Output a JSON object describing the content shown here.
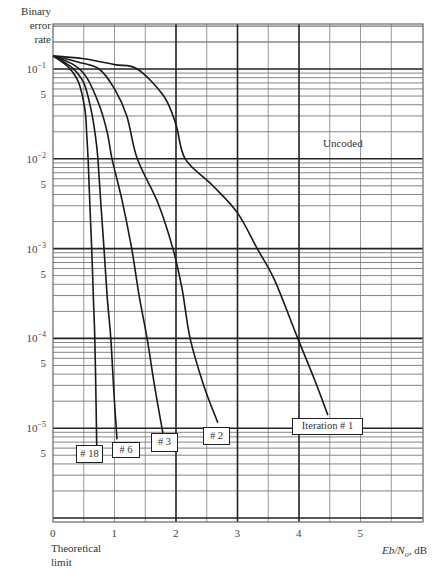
{
  "chart_data": {
    "type": "line",
    "title": "",
    "ylabel": "Binary error rate",
    "xlabel": "Eb/No, dB",
    "xlabel_parts": {
      "main": "Eb/Ν",
      "sub": "o",
      "unit": ", dB"
    },
    "y_scale": "log",
    "ylim": [
      1e-06,
      0.316
    ],
    "xlim": [
      0,
      6
    ],
    "grid": true,
    "x_ticks": [
      {
        "value": 0,
        "label": "0"
      },
      {
        "value": 1,
        "label": "1"
      },
      {
        "value": 2,
        "label": "2"
      },
      {
        "value": 3,
        "label": "3"
      },
      {
        "value": 4,
        "label": "4"
      },
      {
        "value": 5,
        "label": "5"
      }
    ],
    "y_ticks": [
      {
        "value": 0.1,
        "base": "10",
        "exp": "−1"
      },
      {
        "value": 0.05,
        "base": "5",
        "exp": ""
      },
      {
        "value": 0.01,
        "base": "10",
        "exp": "−2"
      },
      {
        "value": 0.005,
        "base": "5",
        "exp": ""
      },
      {
        "value": 0.001,
        "base": "10",
        "exp": "−3"
      },
      {
        "value": 0.0005,
        "base": "5",
        "exp": ""
      },
      {
        "value": 0.0001,
        "base": "10",
        "exp": "−4"
      },
      {
        "value": 5e-05,
        "base": "5",
        "exp": ""
      },
      {
        "value": 1e-05,
        "base": "10",
        "exp": "−5"
      },
      {
        "value": 5e-06,
        "base": "5",
        "exp": ""
      }
    ],
    "annotations": [
      {
        "text": "Uncoded",
        "x": 4.4,
        "y": 0.013
      },
      {
        "text": "Theoretical limit",
        "x": 0,
        "y": "below axis"
      }
    ],
    "series": [
      {
        "name": "Iteration # 1",
        "label": "Iteration # 1",
        "points": [
          [
            0,
            0.14
          ],
          [
            0.5,
            0.13
          ],
          [
            1.0,
            0.112
          ],
          [
            1.37,
            0.1
          ],
          [
            1.8,
            0.05
          ],
          [
            2.0,
            0.024
          ],
          [
            2.15,
            0.01
          ],
          [
            2.6,
            0.005
          ],
          [
            3.0,
            0.0025
          ],
          [
            3.32,
            0.001
          ],
          [
            3.6,
            0.00045
          ],
          [
            3.98,
            0.0001
          ],
          [
            4.25,
            3.5e-05
          ],
          [
            4.47,
            1.4e-05
          ]
        ],
        "label_box": {
          "x": 292,
          "y": 418,
          "w": 71,
          "h": 17
        }
      },
      {
        "name": "# 2",
        "label": "# 2",
        "points": [
          [
            0,
            0.14
          ],
          [
            0.4,
            0.12
          ],
          [
            0.75,
            0.1
          ],
          [
            1.0,
            0.06
          ],
          [
            1.2,
            0.03
          ],
          [
            1.37,
            0.01
          ],
          [
            1.7,
            0.0033
          ],
          [
            1.95,
            0.001
          ],
          [
            2.1,
            0.00035
          ],
          [
            2.23,
            0.0001
          ],
          [
            2.45,
            3e-05
          ],
          [
            2.68,
            1.15e-05
          ]
        ],
        "label_box": {
          "x": 203,
          "y": 427,
          "w": 27,
          "h": 18
        }
      },
      {
        "name": "# 3",
        "label": "# 3",
        "points": [
          [
            0,
            0.14
          ],
          [
            0.35,
            0.11
          ],
          [
            0.55,
            0.08
          ],
          [
            0.75,
            0.04
          ],
          [
            0.88,
            0.02
          ],
          [
            0.96,
            0.01
          ],
          [
            1.12,
            0.0035
          ],
          [
            1.28,
            0.001
          ],
          [
            1.4,
            0.0003
          ],
          [
            1.53,
            0.0001
          ],
          [
            1.65,
            3e-05
          ],
          [
            1.79,
            8.5e-06
          ]
        ],
        "label_box": {
          "x": 151,
          "y": 433,
          "w": 27,
          "h": 19
        }
      },
      {
        "name": "# 6",
        "label": "# 6",
        "points": [
          [
            0,
            0.14
          ],
          [
            0.3,
            0.105
          ],
          [
            0.5,
            0.07
          ],
          [
            0.62,
            0.035
          ],
          [
            0.69,
            0.018
          ],
          [
            0.73,
            0.01
          ],
          [
            0.78,
            0.003
          ],
          [
            0.83,
            0.001
          ],
          [
            0.88,
            0.0003
          ],
          [
            0.94,
            0.0001
          ],
          [
            0.99,
            2.5e-05
          ],
          [
            1.04,
            7.5e-06
          ]
        ],
        "label_box": {
          "x": 112,
          "y": 442,
          "w": 28,
          "h": 16
        }
      },
      {
        "name": "# 18",
        "label": "# 18",
        "points": [
          [
            0,
            0.14
          ],
          [
            0.25,
            0.105
          ],
          [
            0.42,
            0.07
          ],
          [
            0.52,
            0.035
          ],
          [
            0.55,
            0.018
          ],
          [
            0.57,
            0.01
          ],
          [
            0.6,
            0.003
          ],
          [
            0.63,
            0.001
          ],
          [
            0.655,
            0.0003
          ],
          [
            0.68,
            0.0001
          ],
          [
            0.7,
            2e-05
          ],
          [
            0.71,
            6.5e-06
          ]
        ],
        "label_box": {
          "x": 76,
          "y": 445,
          "w": 27,
          "h": 18
        }
      }
    ]
  },
  "labels": {
    "y_title_line1": "Binary",
    "y_title_line2": "error",
    "y_title_line3": "rate",
    "uncoded": "Uncoded",
    "theoretical_line1": "Theoretical",
    "theoretical_line2": "limit",
    "x_title_main": "Eb/Ν",
    "x_title_sub": "o",
    "x_title_unit": ", dB"
  }
}
